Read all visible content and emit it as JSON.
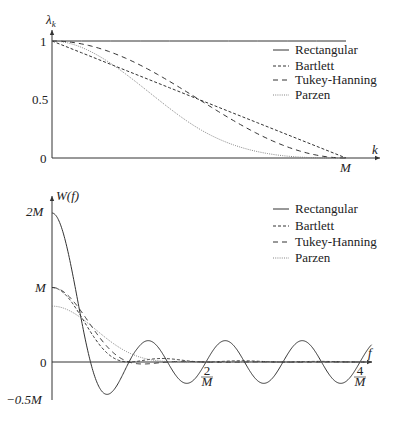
{
  "chart_data": [
    {
      "type": "line",
      "title": "Lag windows",
      "xlabel": "k",
      "ylabel": "λ_k",
      "x_ticks": [
        {
          "value": "M",
          "label": "M"
        }
      ],
      "y_ticks": [
        {
          "value": 0,
          "label": "0"
        },
        {
          "value": 0.5,
          "label": "0.5"
        },
        {
          "value": 1,
          "label": "1"
        }
      ],
      "xlim": [
        0,
        1.1
      ],
      "ylim": [
        0,
        1
      ],
      "x_unit": "M",
      "grid": false,
      "legend_position": "upper right",
      "series": [
        {
          "name": "Rectangular",
          "style": "solid",
          "formula": "1 for 0<=k<=M",
          "x": [
            0,
            0.25,
            0.5,
            0.75,
            1.0
          ],
          "values": [
            1,
            1,
            1,
            1,
            1
          ]
        },
        {
          "name": "Bartlett",
          "style": "dashed-fine",
          "formula": "1 - k/M",
          "x": [
            0,
            0.25,
            0.5,
            0.75,
            1.0
          ],
          "values": [
            1,
            0.75,
            0.5,
            0.25,
            0
          ]
        },
        {
          "name": "Tukey-Hanning",
          "style": "dashed",
          "formula": "0.5(1+cos(pi k/M))",
          "x": [
            0,
            0.25,
            0.5,
            0.75,
            1.0
          ],
          "values": [
            1,
            0.854,
            0.5,
            0.146,
            0
          ]
        },
        {
          "name": "Parzen",
          "style": "dotted",
          "formula": "1-6u^2+6u^3 (u<=0.5); 2(1-u)^3 (u>0.5)",
          "x": [
            0,
            0.25,
            0.5,
            0.75,
            1.0
          ],
          "values": [
            1,
            0.719,
            0.25,
            0.031,
            0
          ]
        }
      ]
    },
    {
      "type": "line",
      "title": "Spectral windows",
      "xlabel": "f",
      "ylabel": "W(f)",
      "x_ticks": [
        {
          "value": 2,
          "label": "2/M"
        },
        {
          "value": 4,
          "label": "4/M"
        }
      ],
      "y_ticks": [
        {
          "value": -0.5,
          "label": "−0.5M"
        },
        {
          "value": 0,
          "label": "0"
        },
        {
          "value": 1,
          "label": "M"
        },
        {
          "value": 2,
          "label": "2M"
        }
      ],
      "xlim": [
        0,
        4.2
      ],
      "ylim": [
        -0.5,
        2.1
      ],
      "x_unit": "1/M",
      "y_unit": "M",
      "grid": false,
      "legend_position": "upper right",
      "series": [
        {
          "name": "Rectangular",
          "style": "solid",
          "formula": "2M sinc(2 pi f M)",
          "x": [
            0,
            0.5,
            0.715,
            1.0,
            1.23,
            1.5,
            2.0,
            2.5,
            3.0,
            3.5,
            4.0
          ],
          "values": [
            2.0,
            0.0,
            -0.43,
            0.0,
            0.25,
            0.0,
            0.0,
            0.0,
            0.0,
            0.0,
            0.0
          ]
        },
        {
          "name": "Bartlett",
          "style": "dashed-fine",
          "formula": "M sinc^2(pi f M)",
          "x": [
            0,
            0.25,
            0.5,
            0.75,
            1.0,
            1.5,
            2.0
          ],
          "values": [
            1.0,
            0.81,
            0.405,
            0.09,
            0.0,
            0.045,
            0.0
          ]
        },
        {
          "name": "Tukey-Hanning",
          "style": "dashed",
          "formula": "M sinc(2pi f M)/(1-(2fM)^2)",
          "x": [
            0,
            0.25,
            0.5,
            0.75,
            1.0,
            1.5,
            2.0
          ],
          "values": [
            1.0,
            0.849,
            0.5,
            0.18,
            0.0,
            -0.02,
            0.0
          ]
        },
        {
          "name": "Parzen",
          "style": "dotted",
          "formula": "0.75M sinc^4(pi f M/2)",
          "x": [
            0,
            0.5,
            1.0,
            1.5,
            2.0,
            3.0,
            4.0
          ],
          "values": [
            0.75,
            0.584,
            0.304,
            0.107,
            0.0,
            0.003,
            0.0
          ]
        }
      ]
    }
  ],
  "top_plot": {
    "ylabel": "λ",
    "ylabel_sub": "k",
    "xlabel": "k",
    "tick_1": "1",
    "tick_05": "0.5",
    "tick_0": "0",
    "tick_M": "M",
    "legend": [
      "Rectangular",
      "Bartlett",
      "Tukey-Hanning",
      "Parzen"
    ]
  },
  "bottom_plot": {
    "ylabel": "W(f)",
    "xlabel": "f",
    "tick_2M": "2M",
    "tick_M": "M",
    "tick_0": "0",
    "tick_neg": "−0.5M",
    "tick_2overM_num": "2",
    "tick_2overM_den": "M",
    "tick_4overM_num": "4",
    "tick_4overM_den": "M",
    "legend": [
      "Rectangular",
      "Bartlett",
      "Tukey-Hanning",
      "Parzen"
    ]
  }
}
